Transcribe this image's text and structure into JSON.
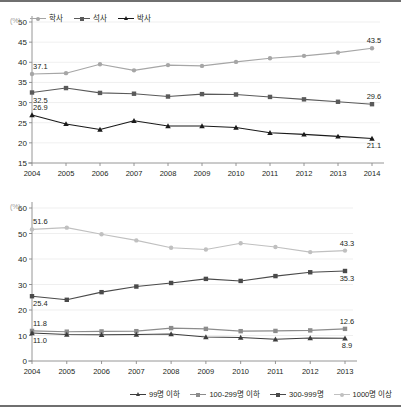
{
  "charts": [
    {
      "id": "top",
      "unit": "(%)",
      "legend": [
        {
          "label": "학사",
          "color": "#a6a6a6",
          "marker": "circle"
        },
        {
          "label": "석사",
          "color": "#5a5a5a",
          "marker": "square"
        },
        {
          "label": "박사",
          "color": "#1a1a1a",
          "marker": "triangle"
        }
      ]
    },
    {
      "id": "bottom",
      "unit": "(%)",
      "legend": [
        {
          "label": "99명 이하",
          "color": "#3c3c3c",
          "marker": "triangle"
        },
        {
          "label": "100-299명 이하",
          "color": "#8c8c8c",
          "marker": "square"
        },
        {
          "label": "300-999명",
          "color": "#4a4a4a",
          "marker": "square"
        },
        {
          "label": "1000명 이상",
          "color": "#c0c0c0",
          "marker": "circle"
        }
      ]
    }
  ],
  "chart_data": [
    {
      "type": "line",
      "title": "",
      "xlabel": "",
      "ylabel": "",
      "unit": "(%)",
      "grid": true,
      "legend_position": "top-left",
      "categories": [
        "2004",
        "2005",
        "2006",
        "2007",
        "2008",
        "2009",
        "2010",
        "2011",
        "2012",
        "2013",
        "2014"
      ],
      "ylim": [
        15,
        50
      ],
      "yticks": [
        15,
        20,
        25,
        30,
        35,
        40,
        45,
        50
      ],
      "series": [
        {
          "name": "학사",
          "color": "#a6a6a6",
          "values": [
            37.1,
            37.3,
            39.5,
            38.0,
            39.3,
            39.1,
            40.1,
            41.0,
            41.6,
            42.4,
            43.5
          ],
          "labels": {
            "first": "37.1",
            "last": "43.5"
          }
        },
        {
          "name": "석사",
          "color": "#5a5a5a",
          "values": [
            32.5,
            33.6,
            32.4,
            32.2,
            31.5,
            32.1,
            32.0,
            31.4,
            30.8,
            30.2,
            29.6
          ],
          "labels": {
            "first": "32.5",
            "last": "29.6"
          }
        },
        {
          "name": "박사",
          "color": "#1a1a1a",
          "values": [
            26.9,
            24.7,
            23.3,
            25.5,
            24.2,
            24.2,
            23.8,
            22.5,
            22.1,
            21.6,
            21.1
          ],
          "labels": {
            "first": "26.9",
            "last": "21.1"
          }
        }
      ]
    },
    {
      "type": "line",
      "title": "",
      "xlabel": "",
      "ylabel": "",
      "unit": "(%)",
      "grid": true,
      "legend_position": "bottom",
      "categories": [
        "2004",
        "2005",
        "2006",
        "2007",
        "2008",
        "2009",
        "2010",
        "2011",
        "2012",
        "2013"
      ],
      "ylim": [
        0,
        60
      ],
      "yticks": [
        0,
        10,
        20,
        30,
        40,
        50,
        60
      ],
      "series": [
        {
          "name": "1000명 이상",
          "color": "#c0c0c0",
          "values": [
            51.6,
            52.3,
            49.7,
            47.3,
            44.4,
            43.7,
            46.2,
            44.7,
            42.7,
            43.3
          ],
          "labels": {
            "first": "51.6",
            "last": "43.3"
          }
        },
        {
          "name": "300-999명",
          "color": "#4a4a4a",
          "values": [
            25.4,
            24.0,
            27.0,
            29.2,
            30.6,
            32.2,
            31.4,
            33.3,
            34.8,
            35.3
          ],
          "labels": {
            "first": "25.4",
            "last": "35.3"
          }
        },
        {
          "name": "100-299명 이하",
          "color": "#8c8c8c",
          "values": [
            11.8,
            11.5,
            11.6,
            11.7,
            12.9,
            12.6,
            11.7,
            11.8,
            12.0,
            12.6
          ],
          "labels": {
            "first": "11.8",
            "last": "12.6"
          }
        },
        {
          "name": "99명 이하",
          "color": "#3c3c3c",
          "values": [
            11.0,
            10.4,
            10.3,
            10.4,
            10.6,
            9.4,
            9.2,
            8.5,
            9.0,
            8.9
          ],
          "labels": {
            "first": "11.0",
            "last": "8.9"
          }
        }
      ]
    }
  ]
}
